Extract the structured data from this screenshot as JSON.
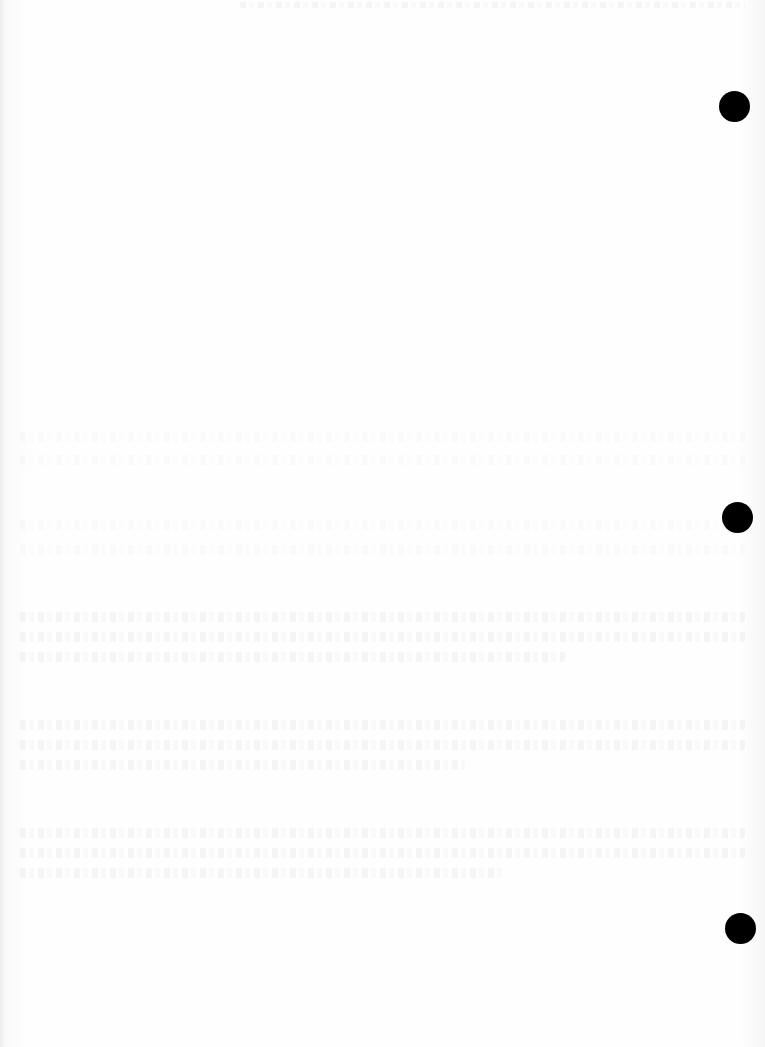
{
  "document": {
    "type": "blank scanned page",
    "description": "Blank paper sheet with faint, illegible show-through text from the reverse side",
    "hole_punches": [
      {
        "cx": 734,
        "cy": 106,
        "r": 15
      },
      {
        "cx": 737,
        "cy": 517,
        "r": 15
      },
      {
        "cx": 740,
        "cy": 928,
        "r": 15
      }
    ],
    "colors": {
      "paper": "#fdfdfd",
      "hole": "#000000"
    }
  }
}
